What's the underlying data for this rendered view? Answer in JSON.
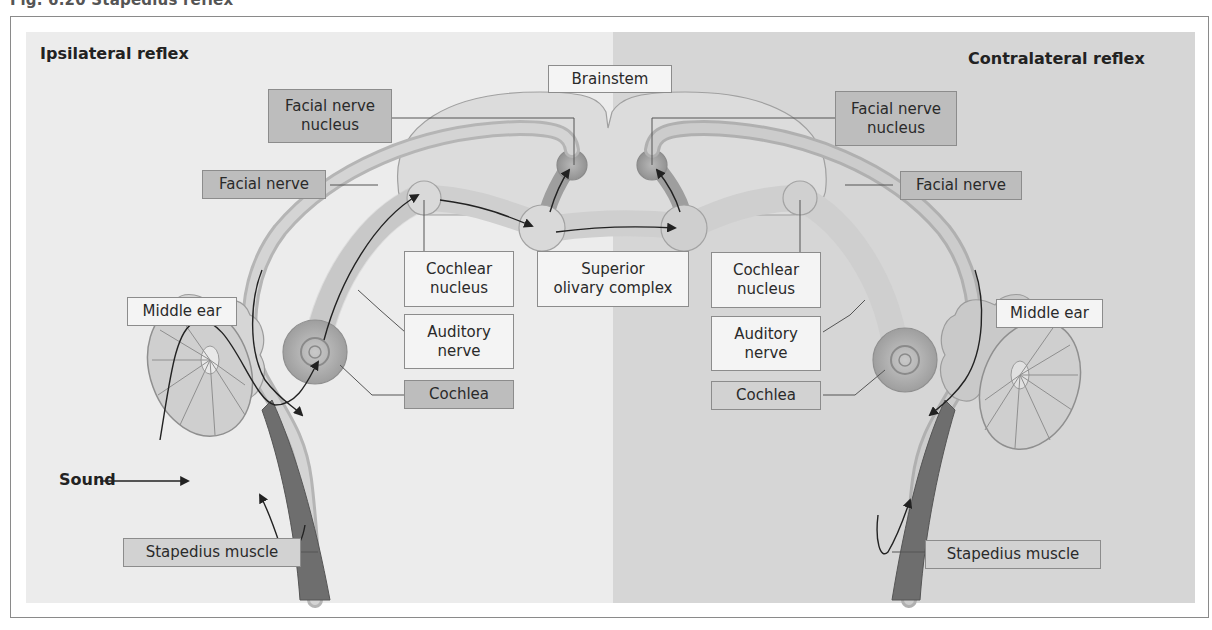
{
  "caption": "Fig. 6.20  Stapedius reflex",
  "panels": {
    "left": {
      "heading": "Ipsilateral reflex",
      "color": "#ececec"
    },
    "right": {
      "heading": "Contralateral reflex",
      "color": "#d6d6d6"
    }
  },
  "labels": {
    "brainstem": "Brainstem",
    "superior_olivary": "Superior\nolivary complex",
    "left": {
      "facial_nerve_nucleus": "Facial nerve\nnucleus",
      "facial_nerve": "Facial nerve",
      "cochlear_nucleus": "Cochlear\nnucleus",
      "auditory_nerve": "Auditory\nnerve",
      "cochlea": "Cochlea",
      "middle_ear": "Middle ear",
      "stapedius_muscle": "Stapedius muscle",
      "sound": "Sound"
    },
    "right": {
      "facial_nerve_nucleus": "Facial nerve\nnucleus",
      "facial_nerve": "Facial nerve",
      "cochlear_nucleus": "Cochlear\nnucleus",
      "auditory_nerve": "Auditory\nnerve",
      "cochlea": "Cochlea",
      "middle_ear": "Middle ear",
      "stapedius_muscle": "Stapedius muscle"
    }
  },
  "colors": {
    "label_dark_fill": "#bdbdbd",
    "label_light_fill": "#f4f4f4",
    "outline": "#8c8c8c",
    "muscle": "#6e6e6e"
  }
}
